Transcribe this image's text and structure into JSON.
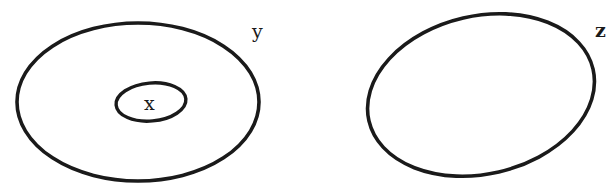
{
  "diagram": {
    "type": "set-diagram",
    "stroke_color": "#1a1a1a",
    "background": "#ffffff",
    "sets": [
      {
        "id": "y",
        "label": "y",
        "contains": [
          "x"
        ]
      },
      {
        "id": "x",
        "label": "x",
        "contained_in": "y"
      },
      {
        "id": "z",
        "label": "z",
        "disjoint_from": [
          "x",
          "y"
        ]
      }
    ]
  }
}
